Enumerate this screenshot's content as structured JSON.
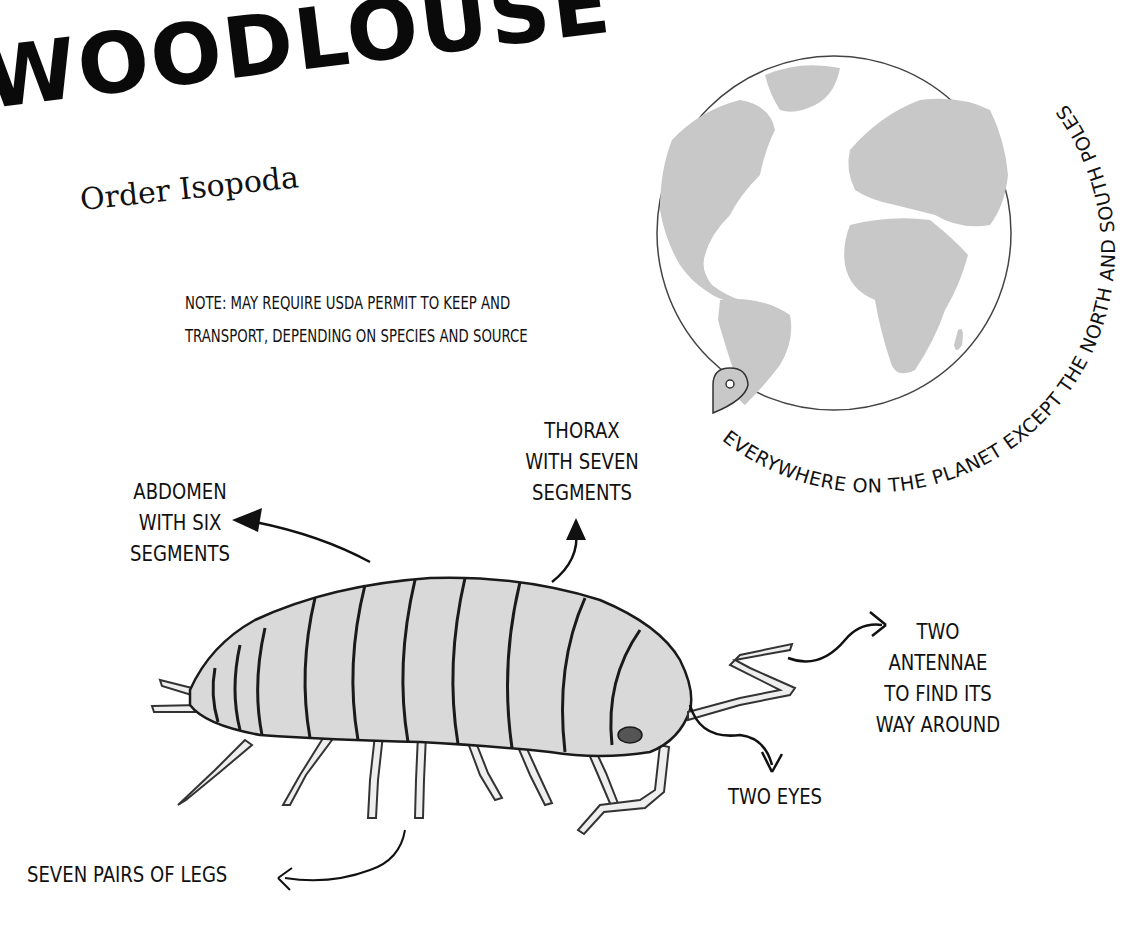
{
  "header": {
    "title": "WOODLOUSE",
    "subtitle": "Order Isopoda"
  },
  "note": {
    "line1": "NOTE: MAY REQUIRE USDA PERMIT TO KEEP AND",
    "line2": "TRANSPORT, DEPENDING ON SPECIES AND SOURCE"
  },
  "range_map": {
    "caption": "EVERYWHERE ON THE PLANET EXCEPT THE NORTH AND SOUTH POLES",
    "icon": "location-pin-icon",
    "land_color": "#c8c8c8",
    "outline_color": "#333333"
  },
  "labels": {
    "abdomen": [
      "ABDOMEN",
      "WITH SIX",
      "SEGMENTS"
    ],
    "thorax": [
      "THORAX",
      "WITH SEVEN",
      "SEGMENTS"
    ],
    "antennae": [
      "TWO",
      "ANTENNAE",
      "TO FIND ITS",
      "WAY AROUND"
    ],
    "eyes": "TWO EYES",
    "legs": "SEVEN PAIRS OF LEGS"
  },
  "illustration": {
    "subject": "woodlouse",
    "body_color": "#d9d9d9",
    "ink_color": "#1a1a1a"
  }
}
